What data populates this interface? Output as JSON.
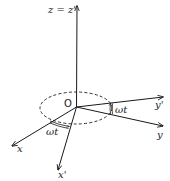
{
  "diagram": {
    "type": "rotating-frame-axes",
    "colors": {
      "stroke": "#1a1a1a",
      "background": "#ffffff"
    },
    "origin": {
      "label": "O"
    },
    "axes": {
      "z": {
        "label": "z = z'"
      },
      "x": {
        "label": "x"
      },
      "y": {
        "label": "y"
      },
      "x_prime": {
        "label": "x'"
      },
      "y_prime": {
        "label": "y'"
      }
    },
    "angles": [
      {
        "id": "angle-y",
        "label": "ωt",
        "between": [
          "y",
          "y'"
        ]
      },
      {
        "id": "angle-x",
        "label": "ωt",
        "between": [
          "x",
          "x'"
        ]
      }
    ],
    "ellipse": {
      "style": "dashed"
    }
  }
}
